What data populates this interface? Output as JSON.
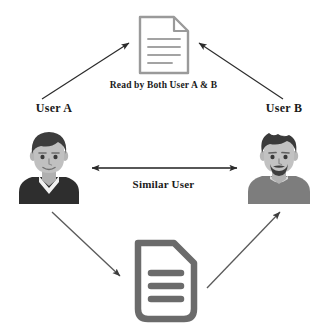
{
  "diagram": {
    "background_color": "#ffffff",
    "text_color": "#1a1a1a",
    "nodes": [
      {
        "id": "doc-top",
        "type": "document",
        "icon": "document-icon",
        "style": "thin-outline",
        "color": "#9a9a9a",
        "line_count": 4
      },
      {
        "id": "user-a",
        "type": "person",
        "icon": "user-avatar-icon",
        "label": "User A",
        "hair_color": "#3c3c3c",
        "skin_color": "#bdbdbd",
        "clothing_color": "#2e2e2e",
        "collar_color": "#f2f2f2",
        "beard": "false"
      },
      {
        "id": "user-b",
        "type": "person",
        "icon": "user-avatar-icon",
        "label": "User B",
        "hair_color": "#3a3a3a",
        "skin_color": "#c2c2c2",
        "clothing_color": "#7d7d7d",
        "collar_color": "#d9d9d9",
        "beard": "true"
      },
      {
        "id": "doc-bottom",
        "type": "document",
        "icon": "document-icon",
        "style": "thick-outline",
        "color": "#6b6b6b",
        "line_count": 3
      }
    ],
    "edges": [
      {
        "id": "edge-user-a-to-doc-top",
        "from": "user-a",
        "to": "doc-top",
        "direction": "one-way",
        "color": "#2b2b2b"
      },
      {
        "id": "edge-user-b-to-doc-top",
        "from": "user-b",
        "to": "doc-top",
        "direction": "one-way",
        "color": "#2b2b2b"
      },
      {
        "id": "edge-user-a-user-b",
        "from": "user-a",
        "to": "user-b",
        "direction": "two-way",
        "color": "#1f1f1f",
        "label": "Similar User"
      },
      {
        "id": "edge-user-a-to-doc-bottom",
        "from": "user-a",
        "to": "doc-bottom",
        "direction": "one-way",
        "color": "#5a5a5a"
      },
      {
        "id": "edge-doc-bottom-to-user-b",
        "from": "doc-bottom",
        "to": "user-b",
        "direction": "one-way",
        "color": "#5a5a5a"
      }
    ],
    "labels": {
      "read_by_both": "Read by Both User A & B",
      "similar_user": "Similar User",
      "user_a": "User A",
      "user_b": "User B"
    }
  }
}
